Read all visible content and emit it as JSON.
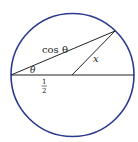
{
  "diagram": {
    "colors": {
      "circle": "#2b3a8f",
      "lines": "#222222",
      "background": "#ffffff"
    },
    "labels": {
      "chord": "cos θ",
      "angle": "θ",
      "radius_segment": "x",
      "half_numerator": "1",
      "half_denominator": "2"
    }
  }
}
